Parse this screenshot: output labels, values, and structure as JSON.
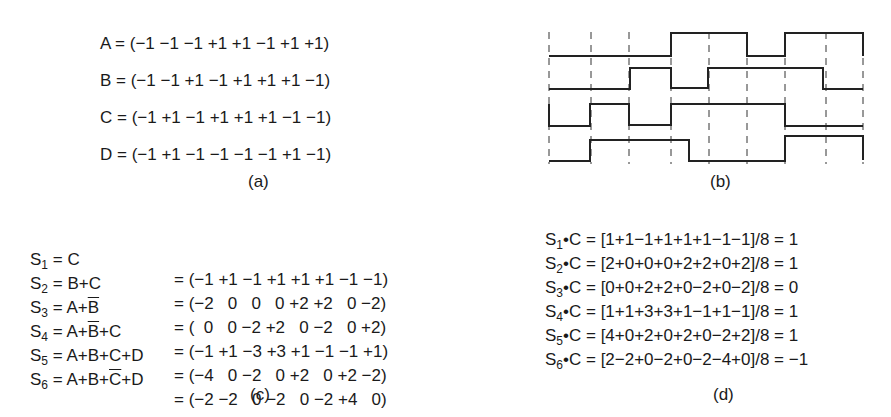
{
  "panel_a": {
    "caption": "(a)",
    "rows": [
      {
        "label": "A",
        "text": "A = (−1 −1 −1 +1 +1 −1 +1 +1)",
        "chips": [
          -1,
          -1,
          -1,
          1,
          1,
          -1,
          1,
          1
        ]
      },
      {
        "label": "B",
        "text": "B = (−1 −1 +1 −1 +1 +1 +1 −1)",
        "chips": [
          -1,
          -1,
          1,
          -1,
          1,
          1,
          1,
          -1
        ]
      },
      {
        "label": "C",
        "text": "C = (−1 +1 −1 +1 +1 +1 −1 −1)",
        "chips": [
          -1,
          1,
          -1,
          1,
          1,
          1,
          -1,
          -1
        ]
      },
      {
        "label": "D",
        "text": "D = (−1 +1 −1 −1 −1 −1 +1 −1)",
        "chips": [
          -1,
          1,
          -1,
          -1,
          -1,
          -1,
          1,
          -1
        ]
      }
    ]
  },
  "panel_b": {
    "caption": "(b)",
    "description": "Bipolar chip sequence waveforms for A, B, C, D"
  },
  "panel_c": {
    "caption": "(c)",
    "rows": [
      {
        "s": "S",
        "sub": "1",
        "expr_pre": " = C",
        "expr_ov": "",
        "expr_post": "",
        "result": "= (−1 +1 −1 +1 +1 +1 −1 −1)"
      },
      {
        "s": "S",
        "sub": "2",
        "expr_pre": " = B+C",
        "expr_ov": "",
        "expr_post": "",
        "result": "= (−2   0   0   0 +2 +2   0 −2)"
      },
      {
        "s": "S",
        "sub": "3",
        "expr_pre": " = A+",
        "expr_ov": "B",
        "expr_post": "",
        "result": "= (  0   0 −2 +2   0 −2   0 +2)"
      },
      {
        "s": "S",
        "sub": "4",
        "expr_pre": " = A+",
        "expr_ov": "B",
        "expr_post": "+C",
        "result": "= (−1 +1 −3 +3 +1 −1 −1 +1)"
      },
      {
        "s": "S",
        "sub": "5",
        "expr_pre": " = A+B+C+D",
        "expr_ov": "",
        "expr_post": "",
        "result": "= (−4   0 −2   0 +2   0 +2 −2)"
      },
      {
        "s": "S",
        "sub": "6",
        "expr_pre": " = A+B+",
        "expr_ov": "C",
        "expr_post": "+D",
        "result": "= (−2 −2   0 −2   0 −2 +4   0)"
      }
    ]
  },
  "panel_d": {
    "caption": "(d)",
    "rows": [
      {
        "s": "S",
        "sub": "1",
        "text": "•C = [1+1−1+1+1+1−1−1]/8 = 1"
      },
      {
        "s": "S",
        "sub": "2",
        "text": "•C = [2+0+0+0+2+2+0+2]/8 = 1"
      },
      {
        "s": "S",
        "sub": "3",
        "text": "•C = [0+0+2+2+0−2+0−2]/8 = 0"
      },
      {
        "s": "S",
        "sub": "4",
        "text": "•C = [1+1+3+3+1−1+1−1]/8 = 1"
      },
      {
        "s": "S",
        "sub": "5",
        "text": "•C = [4+0+2+0+2+0−2+2]/8 = 1"
      },
      {
        "s": "S",
        "sub": "6",
        "text": "•C = [2−2+0−2+0−2−4+0]/8 = −1"
      }
    ]
  },
  "colors": {
    "ink": "#1a1a1a",
    "background": "#ffffff"
  }
}
